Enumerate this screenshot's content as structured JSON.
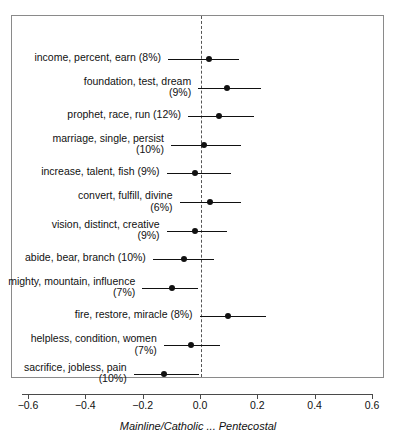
{
  "chart_data": {
    "type": "scatter",
    "title": "",
    "subtitle": "",
    "xlabel": "Mainline/Catholic ... Pentecostal",
    "ylabel": "",
    "xlim": [
      -0.7,
      0.7
    ],
    "xticks": [
      -0.6,
      -0.4,
      -0.2,
      0.0,
      0.2,
      0.4,
      0.6
    ],
    "xticklabels": [
      "−0.6",
      "−0.4",
      "−0.2",
      "0.0",
      "0.2",
      "0.4",
      "0.6"
    ],
    "grid": false,
    "legend": null,
    "reference_line": {
      "x": 0.0,
      "style": "dashed"
    },
    "note": "Coefficient plot with point estimates and horizontal confidence intervals.",
    "categories": [
      "income, percent, earn (8%)",
      "foundation, test, dream\n(9%)",
      "prophet, race, run (12%)",
      "marriage, single, persist\n(10%)",
      "increase, talent, fish (9%)",
      "convert, fulfill, divine\n(6%)",
      "vision, distinct, creative\n(9%)",
      "abide, bear, branch (10%)",
      "mighty, mountain, influence\n(7%)",
      "fire, restore, miracle (8%)",
      "helpless, condition, women\n(7%)",
      "sacrifice, jobless, pain\n(10%)"
    ],
    "points": [
      {
        "label": "income, percent, earn (8%)",
        "estimate": 0.028,
        "ci_low": -0.115,
        "ci_high": 0.132
      },
      {
        "label": "foundation, test, dream (9%)",
        "estimate": 0.09,
        "ci_low": -0.01,
        "ci_high": 0.21
      },
      {
        "label": "prophet, race, run (12%)",
        "estimate": 0.063,
        "ci_low": -0.045,
        "ci_high": 0.185
      },
      {
        "label": "marriage, single, persist (10%)",
        "estimate": 0.012,
        "ci_low": -0.105,
        "ci_high": 0.14
      },
      {
        "label": "increase, talent, fish (9%)",
        "estimate": -0.02,
        "ci_low": -0.12,
        "ci_high": 0.105
      },
      {
        "label": "convert, fulfill, divine (6%)",
        "estimate": 0.032,
        "ci_low": -0.075,
        "ci_high": 0.14
      },
      {
        "label": "vision, distinct, creative (9%)",
        "estimate": -0.02,
        "ci_low": -0.12,
        "ci_high": 0.09
      },
      {
        "label": "abide, bear, branch (10%)",
        "estimate": -0.06,
        "ci_low": -0.168,
        "ci_high": 0.045
      },
      {
        "label": "mighty, mountain, influence (7%)",
        "estimate": -0.1,
        "ci_low": -0.205,
        "ci_high": -0.01
      },
      {
        "label": "fire, restore, miracle (8%)",
        "estimate": 0.095,
        "ci_low": -0.005,
        "ci_high": 0.228
      },
      {
        "label": "helpless, condition, women (7%)",
        "estimate": -0.035,
        "ci_low": -0.13,
        "ci_high": 0.068
      },
      {
        "label": "sacrifice, jobless, pain (10%)",
        "estimate": -0.13,
        "ci_low": -0.235,
        "ci_high": -0.007
      }
    ]
  }
}
